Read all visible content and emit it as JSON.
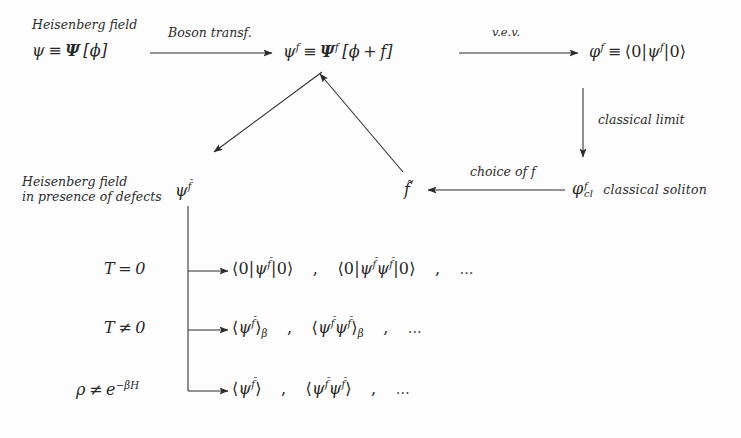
{
  "diagram": {
    "background_color": "#fdfdfd",
    "ink_color": "#2b2b2b",
    "nodes": {
      "heisenberg_caption": "Heisenberg field",
      "heisenberg_field": "ψ ≡ Ψ [φ]",
      "psi_f": "ψ^f ≡ Ψ^f [φ + f]",
      "phi_f": "φ^f ≡ ⟨0|ψ^f|0⟩",
      "defects_caption_line1": "Heisenberg field",
      "defects_caption_line2": "in presence of defects",
      "psi_ftilde": "ψ^f̃",
      "f_tilde": "f̃",
      "phi_cl": "φ_cl^f",
      "classical_soliton": "classical soliton"
    },
    "arrow_labels": {
      "boson_transf": "Boson transf.",
      "vev": "v.e.v.",
      "classical_limit": "classical limit",
      "choice_of_f": "choice of f"
    },
    "rows": [
      {
        "condition": "T = 0",
        "expressions": [
          "⟨0|ψ^f̃|0⟩",
          "⟨0|ψ^f̃ψ^f̃|0⟩"
        ],
        "separator": ",",
        "ellipsis": "..."
      },
      {
        "condition": "T ≠ 0",
        "expressions": [
          "⟨ψ^f̃⟩_β",
          "⟨ψ^f̃ψ^f̃⟩_β"
        ],
        "separator": ",",
        "ellipsis": "..."
      },
      {
        "condition": "ρ ≠ e^{-βH}",
        "expressions": [
          "⟨ψ^f̃⟩",
          "⟨ψ^f̃ψ^f̃⟩"
        ],
        "separator": ",",
        "ellipsis": "..."
      }
    ]
  }
}
